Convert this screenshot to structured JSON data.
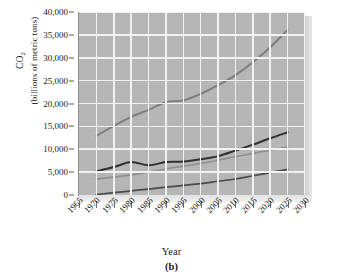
{
  "chart_data": {
    "type": "line",
    "title": "",
    "caption": "(b)",
    "xlabel": "Year",
    "ylabel_line1": "CO",
    "ylabel_sub": "2",
    "ylabel_line2": "(billions of metric tons)",
    "grid": true,
    "legend": "none",
    "xlim": [
      1965,
      2030
    ],
    "ylim": [
      0,
      40000
    ],
    "xticks": [
      1965,
      1970,
      1975,
      1980,
      1985,
      1990,
      1995,
      2000,
      2005,
      2010,
      2015,
      2020,
      2025,
      2030
    ],
    "xticklabels": [
      "1965",
      "1970",
      "1975",
      "1980",
      "1985",
      "1990",
      "1995",
      "2000",
      "2005",
      "2010",
      "2015",
      "2020",
      "2025",
      "2030"
    ],
    "yticks": [
      0,
      5000,
      10000,
      15000,
      20000,
      25000,
      30000,
      35000,
      40000
    ],
    "yticklabels": [
      "0",
      "5,000",
      "10,000",
      "15,000",
      "20,000",
      "25,000",
      "30,000",
      "35,000",
      "40,000"
    ],
    "x": [
      1970,
      1975,
      1980,
      1985,
      1990,
      1995,
      2000,
      2005,
      2010,
      2015,
      2020,
      2025
    ],
    "series": [
      {
        "name": "total-projection",
        "color": "#7d7d7d",
        "width": 1.9,
        "values": [
          12900,
          15100,
          17100,
          18600,
          20300,
          20700,
          22100,
          24000,
          26200,
          29000,
          32300,
          36100
        ]
      },
      {
        "name": "upper-middle",
        "color": "#2e2e2e",
        "width": 2.0,
        "values": [
          5200,
          6100,
          7200,
          6500,
          7200,
          7300,
          7800,
          8500,
          9700,
          11000,
          12400,
          13700
        ]
      },
      {
        "name": "lower-middle",
        "color": "#8f8f8f",
        "width": 1.6,
        "values": [
          3500,
          3900,
          4400,
          5000,
          5700,
          6300,
          6900,
          7600,
          8400,
          9100,
          9800,
          10500
        ]
      },
      {
        "name": "bottom",
        "color": "#4a4a4a",
        "width": 1.7,
        "values": [
          100,
          500,
          900,
          1300,
          1700,
          2100,
          2500,
          3000,
          3500,
          4200,
          4900,
          5600
        ]
      }
    ]
  }
}
